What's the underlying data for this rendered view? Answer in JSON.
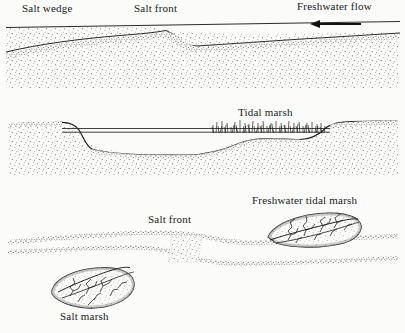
{
  "figure": {
    "background_color": "#fbfbfa",
    "ink_color": "#1a1a1a",
    "stipple_color": "#3a3a3a",
    "width": 405,
    "height": 333
  },
  "panels": [
    {
      "id": "panel-longitudinal-profile",
      "view": "longitudinal cross-section",
      "labels": [
        {
          "id": "salt-wedge",
          "text": "Salt wedge",
          "x": 22,
          "y": 4
        },
        {
          "id": "salt-front-upper",
          "text": "Salt front",
          "x": 134,
          "y": 4
        },
        {
          "id": "freshwater-flow",
          "text": "Freshwater flow",
          "x": 297,
          "y": 2
        }
      ],
      "arrows": [
        {
          "id": "freshwater-flow-arrow",
          "direction": "left",
          "x1": 361,
          "y1": 24,
          "x2": 311,
          "y2": 24
        }
      ]
    },
    {
      "id": "panel-channel-cross-section",
      "view": "channel cross-section",
      "labels": [
        {
          "id": "tidal-marsh",
          "text": "Tidal marsh",
          "x": 238,
          "y": 108
        }
      ]
    },
    {
      "id": "panel-plan-view",
      "view": "plan view",
      "labels": [
        {
          "id": "freshwater-tidal-marsh",
          "text": "Freshwater tidal marsh",
          "x": 252,
          "y": 196
        },
        {
          "id": "salt-front-lower",
          "text": "Salt front",
          "x": 148,
          "y": 215
        },
        {
          "id": "salt-marsh",
          "text": "Salt marsh",
          "x": 60,
          "y": 312
        }
      ]
    }
  ]
}
